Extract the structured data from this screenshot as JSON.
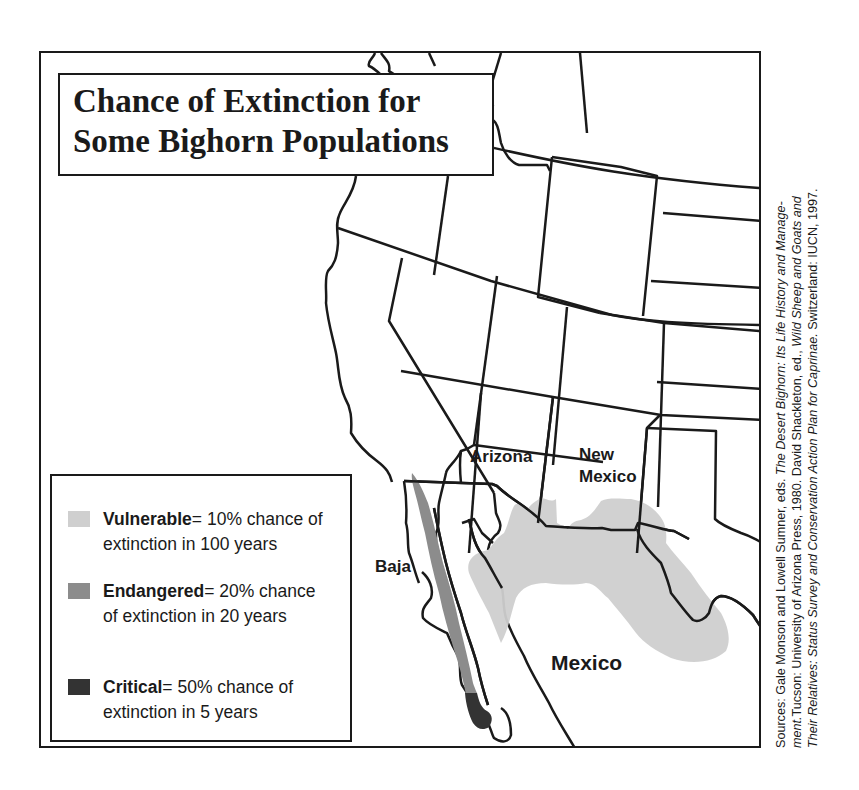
{
  "title": {
    "line1": "Chance of Extinction for",
    "line2": "Some Bighorn Populations"
  },
  "map_labels": {
    "arizona": "Arizona",
    "new_mexico_1": "New",
    "new_mexico_2": "Mexico",
    "baja": "Baja",
    "mexico": "Mexico"
  },
  "legend": {
    "items": [
      {
        "term": "Vulnerable",
        "desc": "= 10% chance of extinction in 100 years",
        "color": "#cfcfcf"
      },
      {
        "term": "Endangered",
        "desc": "= 20% chance of extinction in 20 years",
        "color": "#8c8c8c"
      },
      {
        "term": "Critical",
        "desc": "= 50% chance of extinction in 5 years",
        "color": "#333333"
      }
    ]
  },
  "source": {
    "line1_a": "Sources: Gale Monson and Lowell Sumner, eds. ",
    "line1_b": "The Desert Bighorn: Its Life History and Manage-",
    "line2_a": "ment.",
    "line2_b": "Tucson: University of Arizona Press, 1980. David Shackleton, ed., ",
    "line2_c": "Wild Sheep  and Goats and",
    "line3_a": "Their Relatives: Status Survey and Conservation Action Plan for Caprinae.",
    "line3_b": " Switzerland: IUCN, 1997."
  },
  "colors": {
    "vulnerable": "#cfcfcf",
    "endangered": "#8c8c8c",
    "critical": "#333333",
    "line": "#1a1a1a"
  }
}
